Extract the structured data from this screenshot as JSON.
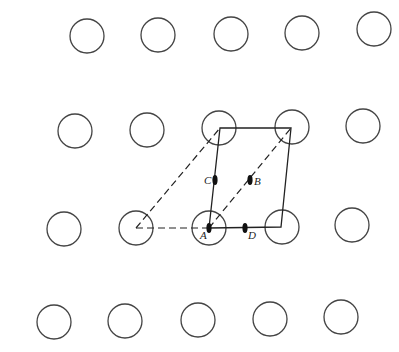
{
  "diagram": {
    "type": "2D lattice with unit cell and symmetry elements",
    "colors": {
      "stroke": "#444444",
      "line": "#222222",
      "background": "#ffffff"
    },
    "atom_radius": 17,
    "lattice_points": [
      {
        "row": 1,
        "x": 87,
        "y": 36
      },
      {
        "row": 1,
        "x": 158,
        "y": 35
      },
      {
        "row": 1,
        "x": 231,
        "y": 34
      },
      {
        "row": 1,
        "x": 302,
        "y": 33
      },
      {
        "row": 1,
        "x": 374,
        "y": 29
      },
      {
        "row": 2,
        "x": 75,
        "y": 131
      },
      {
        "row": 2,
        "x": 147,
        "y": 130
      },
      {
        "row": 2,
        "x": 219,
        "y": 128
      },
      {
        "row": 2,
        "x": 292,
        "y": 127
      },
      {
        "row": 2,
        "x": 363,
        "y": 126
      },
      {
        "row": 3,
        "x": 64,
        "y": 229
      },
      {
        "row": 3,
        "x": 136,
        "y": 228
      },
      {
        "row": 3,
        "x": 209,
        "y": 228
      },
      {
        "row": 3,
        "x": 282,
        "y": 227
      },
      {
        "row": 3,
        "x": 352,
        "y": 225
      },
      {
        "row": 4,
        "x": 54,
        "y": 322
      },
      {
        "row": 4,
        "x": 125,
        "y": 321
      },
      {
        "row": 4,
        "x": 198,
        "y": 320
      },
      {
        "row": 4,
        "x": 270,
        "y": 319
      },
      {
        "row": 4,
        "x": 341,
        "y": 317
      }
    ],
    "unit_cell_solid": {
      "vertices": [
        [
          209,
          228
        ],
        [
          220,
          128
        ],
        [
          291,
          128
        ],
        [
          281,
          227
        ]
      ]
    },
    "unit_cell_dashed": {
      "segments": [
        [
          [
            136,
            228
          ],
          [
            220,
            128
          ]
        ],
        [
          [
            136,
            228
          ],
          [
            209,
            228
          ]
        ],
        [
          [
            209,
            228
          ],
          [
            291,
            128
          ]
        ]
      ]
    },
    "symmetry_markers": [
      {
        "label": "A",
        "x": 209,
        "y": 228,
        "label_dx": -9,
        "label_dy": 11
      },
      {
        "label": "B",
        "x": 250,
        "y": 180,
        "label_dx": 4,
        "label_dy": 5
      },
      {
        "label": "C",
        "x": 215,
        "y": 180,
        "label_dx": -11,
        "label_dy": 4
      },
      {
        "label": "D",
        "x": 245,
        "y": 228,
        "label_dx": 3,
        "label_dy": 11
      }
    ]
  }
}
